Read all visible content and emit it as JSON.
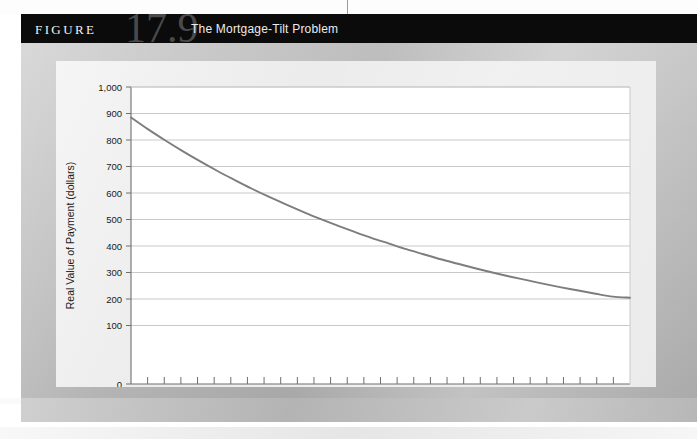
{
  "figure": {
    "label": "FIGURE",
    "number": "17.9",
    "title": "The Mortgage-Tilt Problem"
  },
  "colors": {
    "banner_bg": "#0b0b0b",
    "figure_number": "#4a4a4a",
    "frame": "#bcbcbc",
    "panel": "#e9e9e9",
    "plot_bg": "#ffffff",
    "gridline": "#c9c9c9",
    "axis": "#6e6e6e",
    "curve": "#7d7d7d",
    "tick_label": "#1a1a1a"
  },
  "chart_data": {
    "type": "line",
    "title": "The Mortgage-Tilt Problem",
    "xlabel": "Year",
    "ylabel": "Real Value of Payment (dollars)",
    "xlim": [
      1,
      30
    ],
    "ylim": [
      0,
      1000
    ],
    "grid": true,
    "legend": "none",
    "xticklabels": [
      "1",
      "2",
      "3",
      "4",
      "5",
      "6",
      "7",
      "8",
      "9",
      "10",
      "11",
      "12",
      "13",
      "14",
      "15",
      "16",
      "17",
      "18",
      "19",
      "20",
      "21",
      "22",
      "23",
      "24",
      "25",
      "26",
      "27",
      "28",
      "29",
      "30"
    ],
    "yticklabels": [
      "0",
      "100",
      "200",
      "300",
      "400",
      "500",
      "600",
      "700",
      "800",
      "900",
      "1,000"
    ],
    "ytickvalues": [
      0,
      100,
      200,
      300,
      400,
      500,
      600,
      700,
      800,
      900,
      1000
    ],
    "series": [
      {
        "name": "Real value of payment",
        "x": [
          1,
          2,
          3,
          4,
          5,
          6,
          7,
          8,
          9,
          10,
          11,
          12,
          13,
          14,
          15,
          16,
          17,
          18,
          19,
          20,
          21,
          22,
          23,
          24,
          25,
          26,
          27,
          28,
          29,
          30
        ],
        "values": [
          885,
          840,
          798,
          758,
          720,
          684,
          650,
          617,
          586,
          557,
          529,
          502,
          477,
          453,
          430,
          409,
          388,
          369,
          350,
          333,
          316,
          300,
          285,
          271,
          257,
          244,
          232,
          220,
          209,
          205
        ]
      }
    ]
  }
}
